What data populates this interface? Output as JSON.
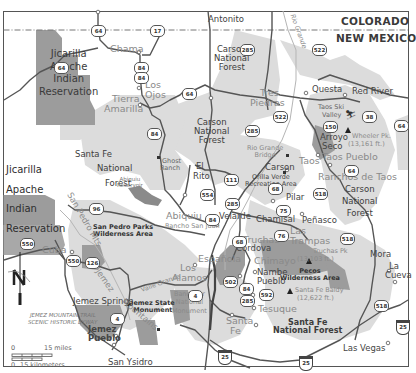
{
  "state_labels": {
    "north": "COLORADO",
    "south": "NEW MEXICO"
  },
  "colors": {
    "background": "#ffffff",
    "national_forest": "#dcdcdc",
    "wilderness_reservation": "#9a9a9a",
    "road": "#555555",
    "border": "#444444"
  },
  "towns": {
    "antonito": "Antonito",
    "chama": "Chama",
    "los_ojos_1": "Los",
    "los_ojos_2": "Ojos",
    "tierra_amarilla_1": "Tierra",
    "tierra_amarilla_2": "Amarilla",
    "tres_piedras_1": "Tres",
    "tres_piedras_2": "Piedras",
    "questa": "Questa",
    "red_river": "Red River",
    "taos_ski_1": "Taos Ski",
    "taos_ski_2": "Valley",
    "arroyo_seco_1": "Arroyo",
    "arroyo_seco_2": "Seco",
    "taos": "Taos",
    "taos_pueblo": "Taos Pueblo",
    "ranchos_de_taos": "Ranchos de Taos",
    "carson": "Carson",
    "pilar": "Pilar",
    "ghost_ranch_1": "Ghost",
    "ghost_ranch_2": "Ranch",
    "el_rito_1": "El",
    "el_rito_2": "Rito",
    "abiquiu": "Abiquiu",
    "rancho_san_juan": "Rancho San Juan",
    "velarde": "Velarde",
    "chamisal": "Chamisal",
    "penasco": "Peñasco",
    "las_trampas_1": "Las",
    "las_trampas_2": "Trampas",
    "truchas": "Truchas",
    "cordova": "Cordova",
    "chimayo": "Chimayo",
    "espanola": "Española",
    "los_alamos_1": "Los",
    "los_alamos_2": "Alamos",
    "nambe_1": "Nambe",
    "nambe_2": "Pueblo",
    "tesuque": "Tesuque",
    "santa_fe_1": "Santa",
    "santa_fe_2": "Fe",
    "cuba": "Cuba",
    "jemez_springs": "Jemez Springs",
    "jemez_pueblo_1": "Jemez",
    "jemez_pueblo_2": "Pueblo",
    "san_ysidro": "San Ysidro",
    "mora": "Mora",
    "la_cueva_1": "La",
    "la_cueva_2": "Cueva",
    "las_vegas": "Las Vegas"
  },
  "areas": {
    "carson_nf_north": [
      "Carson",
      "National",
      "Forest"
    ],
    "carson_nf_mid": [
      "Carson",
      "National",
      "Forest"
    ],
    "carson_nf_east": [
      "Carson",
      "National",
      "Forest"
    ],
    "santa_fe_nf_west": [
      "Santa Fe",
      "National",
      "Forest"
    ],
    "santa_fe_nf_south": [
      "Santa Fe",
      "National Forest"
    ],
    "jicarilla_north": [
      "Jicarilla",
      "Apache",
      "Indian",
      "Reservation"
    ],
    "jicarilla_west": [
      "Jicarilla",
      "Apache",
      "Indian",
      "Reservation"
    ],
    "san_pedro_parks": [
      "San Pedro Parks",
      "Wilderness Area"
    ],
    "pecos": [
      "Pecos",
      "Wilderness Area"
    ],
    "bandelier": [
      "Bandelier",
      "National",
      "Monument"
    ],
    "jemez_state_monument": [
      "Jemez State",
      "Monument"
    ],
    "orilla_verde": [
      "Orilla Verde",
      "Recreation Area"
    ],
    "rio_grande_bridge": [
      "Rio Grande",
      "Bridge"
    ],
    "abiquiu_reservoir": [
      "Abiquiu",
      "Reservoir"
    ]
  },
  "peaks": {
    "wheeler_1": "Wheeler Pk.",
    "wheeler_2": "(13,161 ft.)",
    "truchas_1": "Truchas Pk",
    "truchas_2": "(13,103 ft.)",
    "santa_fe_baldy_1": "Santa Fe Baldy",
    "santa_fe_baldy_2": "(12,622 ft.)"
  },
  "features": {
    "rio_grande": "Rio Grande",
    "san_pedro_mts": "San Pedro Mts",
    "jemez_mountains_1": "Jemez",
    "jemez_mountains_2": "Mountains",
    "valle_grande": "Valle Grande",
    "byway_1": "JEMEZ MOUNTAIN TRAIL",
    "byway_2": "SCENIC HISTORIC BYWAY"
  },
  "routes": {
    "r64a": "64",
    "r64b": "64",
    "r64c": "64",
    "r64d": "64",
    "r64e": "64",
    "r64f": "64",
    "r64g": "64",
    "r64h": "64",
    "r64i": "64",
    "r17": "17",
    "r285a": "285",
    "r285b": "285",
    "r285c": "285",
    "r285d": "285",
    "r522a": "522",
    "r522b": "522",
    "r150": "150",
    "r38": "38",
    "r518a": "518",
    "r518b": "518",
    "r518c": "518",
    "r111": "111",
    "r554": "554",
    "r68a": "68",
    "r68b": "68",
    "r75": "75",
    "r76": "76",
    "r96": "96",
    "r550a": "550",
    "r550b": "550",
    "r126": "126",
    "r4a": "4",
    "r4b": "4",
    "r502": "502",
    "r84": "84",
    "r592": "592",
    "i25a": "25",
    "i25b": "25",
    "i25c": "25"
  },
  "compass": {
    "label": "N"
  },
  "scale": {
    "miles_zero": "0",
    "miles": "15 miles",
    "km_zero": "0",
    "km": "15 kilometers"
  }
}
